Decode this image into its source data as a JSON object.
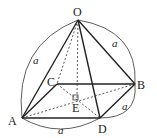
{
  "diagram": {
    "type": "square-pyramid",
    "vertices": {
      "O": {
        "label": "O",
        "x": 78,
        "y": 20
      },
      "A": {
        "label": "A",
        "x": 22,
        "y": 118
      },
      "B": {
        "label": "B",
        "x": 135,
        "y": 84
      },
      "C": {
        "label": "C",
        "x": 57,
        "y": 84
      },
      "D": {
        "label": "D",
        "x": 100,
        "y": 118
      },
      "E": {
        "label": "E",
        "x": 77,
        "y": 99
      }
    },
    "edge_labels": {
      "OA": "a",
      "OB": "a",
      "BD": "a",
      "AD": "a"
    },
    "right_angle_at": "E"
  }
}
